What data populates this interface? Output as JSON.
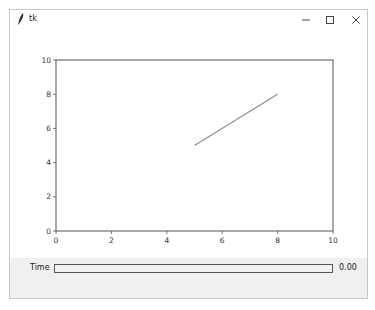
{
  "window": {
    "title": "tk",
    "controls": {
      "minimize": "–",
      "maximize": "☐",
      "close": "✕"
    }
  },
  "slider": {
    "label": "Time",
    "value": "0.00"
  },
  "chart_data": {
    "type": "line",
    "title": "",
    "xlabel": "",
    "ylabel": "",
    "xlim": [
      0,
      10
    ],
    "ylim": [
      0,
      10
    ],
    "xticks": [
      "0",
      "2",
      "4",
      "6",
      "8",
      "10"
    ],
    "yticks": [
      "0",
      "2",
      "4",
      "6",
      "8",
      "10"
    ],
    "grid": false,
    "series": [
      {
        "name": "line",
        "x": [
          5,
          8
        ],
        "y": [
          5,
          8
        ],
        "color": "#8a8f96"
      }
    ]
  }
}
